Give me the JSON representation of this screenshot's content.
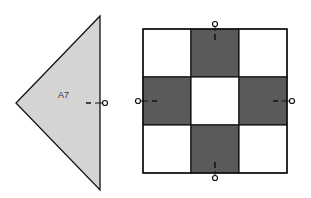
{
  "triangle": {
    "label": "A7",
    "fill": "#d4d4d4",
    "stroke": "#111111",
    "points": [
      [
        100,
        16
      ],
      [
        16,
        103
      ],
      [
        100,
        190
      ]
    ],
    "label_pos": [
      58,
      98
    ],
    "marker": {
      "edge": "right",
      "x": 100,
      "y": 103
    }
  },
  "block": {
    "x": 143,
    "y": 29,
    "cell": 48,
    "light_fill": "#ffffff",
    "dark_fill": "#5a5a5a",
    "stroke": "#111111",
    "grid": [
      [
        "light",
        "dark",
        "light"
      ],
      [
        "dark",
        "light",
        "dark"
      ],
      [
        "light",
        "dark",
        "light"
      ]
    ],
    "markers": [
      "top",
      "left",
      "right",
      "bottom"
    ]
  }
}
